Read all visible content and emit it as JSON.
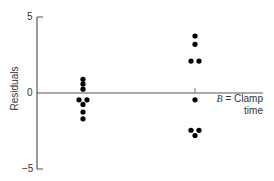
{
  "chart_data": {
    "type": "scatter",
    "title": "",
    "xlabel": "",
    "ylabel": "Residuals",
    "ylim": [
      -5,
      5
    ],
    "yticks": [
      5,
      0,
      -5
    ],
    "ytick_labels": [
      "5",
      "0",
      "−5"
    ],
    "grid": false,
    "legend": null,
    "annotation": {
      "italic": "B",
      "text": " = Clamp",
      "line2": "time"
    },
    "series": [
      {
        "name": "Group 1",
        "x_position": 1,
        "points": [
          {
            "dx": 0,
            "y": 0.9
          },
          {
            "dx": 0,
            "y": 0.6
          },
          {
            "dx": 0,
            "y": 0.25
          },
          {
            "dx": -1,
            "y": -0.45
          },
          {
            "dx": 1,
            "y": -0.45
          },
          {
            "dx": 0,
            "y": -0.75
          },
          {
            "dx": 0,
            "y": -1.25
          },
          {
            "dx": 0,
            "y": -1.7
          }
        ]
      },
      {
        "name": "Group 2 (Clamp time)",
        "x_position": 2,
        "points": [
          {
            "dx": 0,
            "y": 3.75
          },
          {
            "dx": 0,
            "y": 3.2
          },
          {
            "dx": -1,
            "y": 2.1
          },
          {
            "dx": 1,
            "y": 2.1
          },
          {
            "dx": 0,
            "y": -0.45
          },
          {
            "dx": -1,
            "y": -2.45
          },
          {
            "dx": 1,
            "y": -2.45
          },
          {
            "dx": 0,
            "y": -2.8
          }
        ]
      }
    ]
  },
  "layout": {
    "axis_color": "#555555",
    "point_color": "#000000"
  }
}
